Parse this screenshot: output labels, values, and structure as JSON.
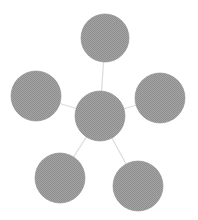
{
  "diagram": {
    "type": "hub-and-spoke",
    "colors": {
      "node_fill": "#9b9b9b",
      "node_edge": "#8a8a8a",
      "edge": "#dcdcdc",
      "background": "#ffffff"
    },
    "hub": {
      "id": "center",
      "cx": 100,
      "cy": 116,
      "r": 25
    },
    "nodes": [
      {
        "id": "top",
        "cx": 105,
        "cy": 38,
        "r": 24
      },
      {
        "id": "left",
        "cx": 36,
        "cy": 96,
        "r": 25
      },
      {
        "id": "right",
        "cx": 160,
        "cy": 98,
        "r": 25
      },
      {
        "id": "bottom-left",
        "cx": 60,
        "cy": 178,
        "r": 25
      },
      {
        "id": "bottom-right",
        "cx": 138,
        "cy": 186,
        "r": 25
      }
    ]
  }
}
